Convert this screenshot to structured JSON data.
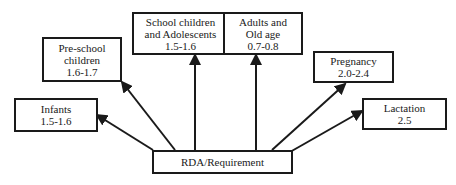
{
  "diagram": {
    "center": {
      "label": "RDA/Requirement"
    },
    "groups": [
      {
        "id": "infants",
        "lines": [
          "Infants",
          "1.5-1.6"
        ]
      },
      {
        "id": "preschool",
        "lines": [
          "Pre-school",
          "children",
          "1.6-1.7"
        ]
      },
      {
        "id": "school",
        "lines": [
          "School children",
          "and Adolescents",
          "1.5-1.6"
        ]
      },
      {
        "id": "adults",
        "lines": [
          "Adults and",
          "Old age",
          "0.7-0.8"
        ]
      },
      {
        "id": "pregnancy",
        "lines": [
          "Pregnancy",
          "2.0-2.4"
        ]
      },
      {
        "id": "lactation",
        "lines": [
          "Lactation",
          "2.5"
        ]
      }
    ]
  }
}
